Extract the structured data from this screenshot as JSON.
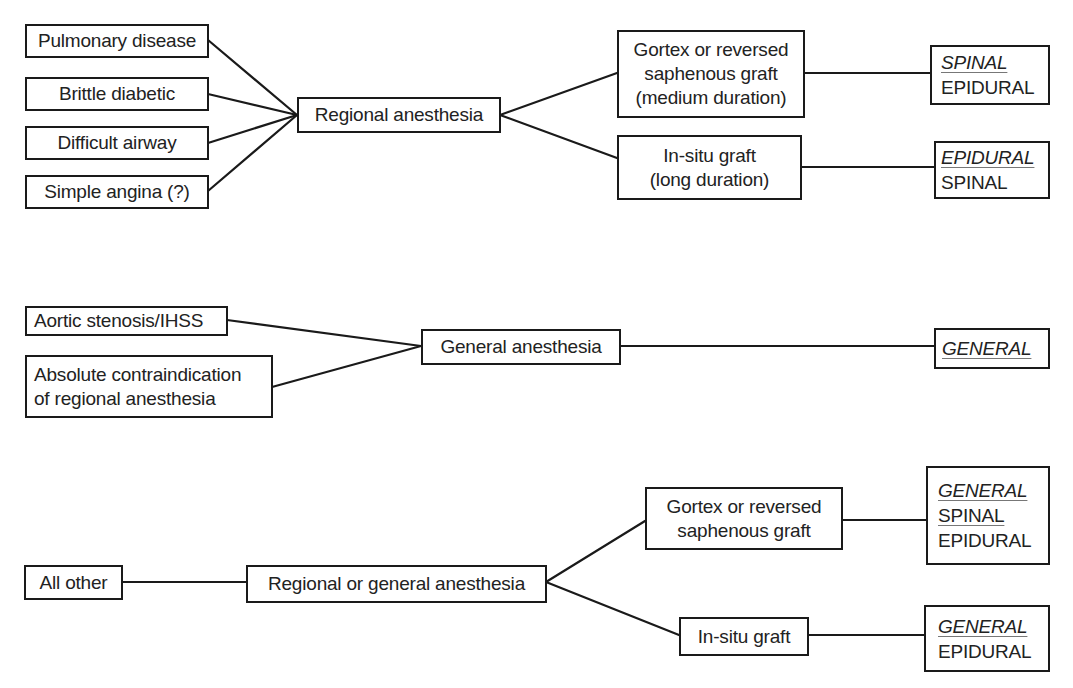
{
  "diagram": {
    "type": "decision-tree",
    "sections": [
      {
        "id": "regional",
        "indications": [
          {
            "label": "Pulmonary disease"
          },
          {
            "label": "Brittle diabetic"
          },
          {
            "label": "Difficult airway"
          },
          {
            "label": "Simple angina (?)"
          }
        ],
        "technique": {
          "label": "Regional anesthesia"
        },
        "grafts": [
          {
            "lines": [
              "Gortex or reversed",
              "saphenous graft",
              "(medium duration)"
            ],
            "options": [
              {
                "label": "SPINAL",
                "style": "preferred"
              },
              {
                "label": "EPIDURAL",
                "style": "plain"
              }
            ]
          },
          {
            "lines": [
              "In-situ graft",
              "(long duration)"
            ],
            "options": [
              {
                "label": "EPIDURAL",
                "style": "preferred"
              },
              {
                "label": "SPINAL",
                "style": "plain"
              }
            ]
          }
        ]
      },
      {
        "id": "general",
        "indications": [
          {
            "lines": [
              "Aortic stenosis/IHSS"
            ]
          },
          {
            "lines": [
              "Absolute contraindication",
              "of regional anesthesia"
            ]
          }
        ],
        "technique": {
          "label": "General anesthesia"
        },
        "options": [
          {
            "label": "GENERAL",
            "style": "preferred"
          }
        ]
      },
      {
        "id": "either",
        "indications": [
          {
            "label": "All other"
          }
        ],
        "technique": {
          "label": "Regional or general anesthesia"
        },
        "grafts": [
          {
            "lines": [
              "Gortex or reversed",
              "saphenous graft"
            ],
            "options": [
              {
                "label": "GENERAL",
                "style": "preferred"
              },
              {
                "label": "SPINAL",
                "style": "underlined"
              },
              {
                "label": "EPIDURAL",
                "style": "plain"
              }
            ]
          },
          {
            "lines": [
              "In-situ graft"
            ],
            "options": [
              {
                "label": "GENERAL",
                "style": "preferred"
              },
              {
                "label": "EPIDURAL",
                "style": "plain"
              }
            ]
          }
        ]
      }
    ],
    "colors": {
      "stroke": "#1a1a1a",
      "background": "#ffffff",
      "text": "#222222"
    }
  }
}
